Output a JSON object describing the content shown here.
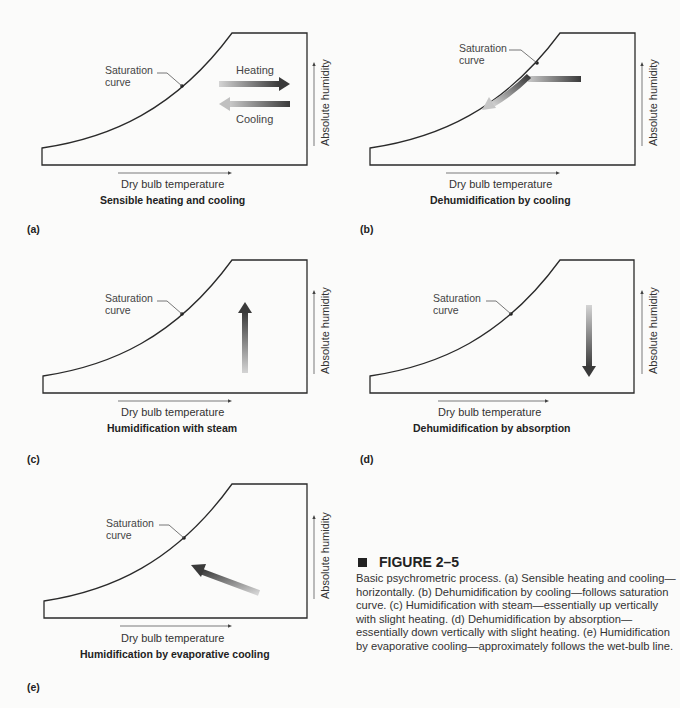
{
  "figure": {
    "number": "FIGURE 2–5",
    "caption": "Basic psychrometric process. (a) Sensible heating and cooling—horizontally. (b) Dehumidification by cooling—follows saturation curve. (c) Humidification with steam—essentially up vertically with slight heating. (d) Dehumidification by absorption—essentially down vertically with slight heating. (e) Humidification by evaporative cooling—approximately follows the wet-bulb line."
  },
  "common": {
    "saturation_label_line1": "Saturation",
    "saturation_label_line2": "curve",
    "x_axis_label": "Dry bulb temperature",
    "y_axis_label": "Absolute humidity"
  },
  "panels": [
    {
      "letter": "(a)",
      "title": "Sensible heating and cooling",
      "process": "horizontal",
      "labels": {
        "heating": "Heating",
        "cooling": "Cooling"
      }
    },
    {
      "letter": "(b)",
      "title": "Dehumidification by cooling",
      "process": "follows-saturation-curve"
    },
    {
      "letter": "(c)",
      "title": "Humidification with steam",
      "process": "vertical-up"
    },
    {
      "letter": "(d)",
      "title": "Dehumidification by absorption",
      "process": "vertical-down"
    },
    {
      "letter": "(e)",
      "title": "Humidification by evaporative cooling",
      "process": "wet-bulb-line"
    }
  ],
  "colors": {
    "line": "#2a2a2a",
    "arrow_dark": "#3a3a3a",
    "arrow_light": "#d0d0d0",
    "background": "#fbfbfa"
  }
}
